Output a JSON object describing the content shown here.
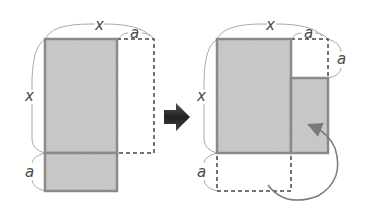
{
  "diagram": {
    "colors": {
      "fill": "#c8c8c8",
      "stroke": "#8a8a8a",
      "dashed": "#444444",
      "bracket": "#aaaaaa",
      "arrow": "#333333",
      "label": "#4a4a4a"
    },
    "left_figure": {
      "labels": {
        "top_width": "x",
        "top_extension": "a",
        "left_height": "x",
        "bottom_height": "a"
      }
    },
    "arrow": {
      "direction": "right"
    },
    "right_figure": {
      "labels": {
        "top_width": "x",
        "top_extension": "a",
        "right_corner_height": "a",
        "left_height": "x",
        "bottom_height": "a"
      },
      "move_arrow": "curved arrow from dashed bottom strip to the right rectangle"
    }
  }
}
